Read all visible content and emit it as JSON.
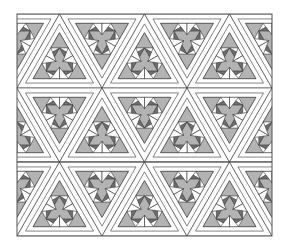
{
  "diagram": {
    "title": "",
    "kind": "quilt-pattern",
    "frame": {
      "x": 17,
      "y": 14,
      "width": 255,
      "height": 222
    },
    "divider_lines_y": [
      88,
      162
    ],
    "rows": 3,
    "colors": {
      "background": "#ffffff",
      "outline": "#333333",
      "frame": "#555555",
      "sashing": "#ffffff",
      "light_fill": "#b3b3b3",
      "dark_fill": "#6e6e6e"
    }
  }
}
